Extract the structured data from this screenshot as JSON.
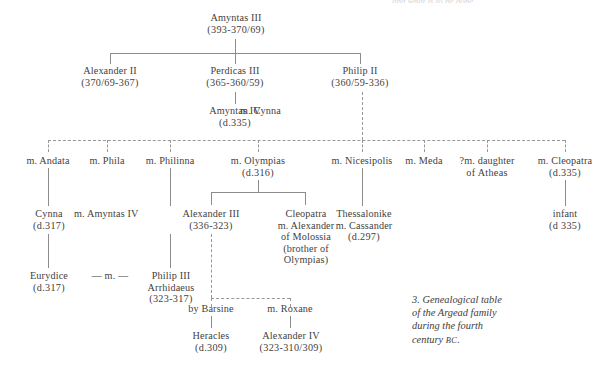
{
  "figure": {
    "caption_line1": "3. Genealogical table",
    "caption_line2": "of the Argead family",
    "caption_line3": "during the fourth",
    "caption_line4": "century ",
    "caption_era": "BC",
    "caption_end": ".",
    "clipped_header": "and what is to be done."
  },
  "colors": {
    "ink": "#444140",
    "rule": "#8e8b88",
    "dashed_rule": "#9a9794",
    "background": "#ffffff"
  },
  "people": {
    "amyntas3": {
      "name": "Amyntas III",
      "dates": "(393-370/69)"
    },
    "alexander2": {
      "name": "Alexander II",
      "dates": "(370/69-367)"
    },
    "perdiccas3": {
      "name": "Perdicas III",
      "dates": "(365-360/59)"
    },
    "philip2": {
      "name": "Philip II",
      "dates": "(360/59-336)"
    },
    "amyntas4": {
      "name": "Amyntas IV",
      "dates": "(d.335)"
    },
    "cynna_wife": {
      "name": "m. Cynna",
      "dates": ""
    },
    "audata": {
      "name": "m. Andata",
      "dates": ""
    },
    "phila": {
      "name": "m. Phila",
      "dates": ""
    },
    "philinna": {
      "name": "m. Philinna",
      "dates": ""
    },
    "olympias": {
      "name": "m. Olympias",
      "dates": "(d.316)"
    },
    "nicesipolis": {
      "name": "m. Nicesipolis",
      "dates": ""
    },
    "meda": {
      "name": "m. Meda",
      "dates": ""
    },
    "atheas_l1": {
      "name": "?m. daughter",
      "dates": "of Atheas"
    },
    "cleopatra_w": {
      "name": "m. Cleopatra",
      "dates": "(d.335)"
    },
    "cynna": {
      "name": "Cynna",
      "dates": "(d.317)"
    },
    "m_amyntas4": {
      "name": "m. Amyntas IV",
      "dates": ""
    },
    "alexander3": {
      "name": "Alexander III",
      "dates": "(336-323)"
    },
    "cleopatra_d": {
      "name": "Cleopatra",
      "l2": "m. Alexander",
      "l3": "of Molossia",
      "l4": "(brother of",
      "l5": "Olympias)"
    },
    "thessalonike": {
      "name": "Thessalonike",
      "l2": "m. Cassander",
      "l3": "(d.297)"
    },
    "infant": {
      "name": "infant",
      "dates": "(d 335)"
    },
    "eurydice": {
      "name": "Eurydice",
      "dates": "(d.317)"
    },
    "marriage_link": {
      "name": "—  m.  —",
      "dates": ""
    },
    "philip3": {
      "name": "Philip III",
      "l2": "Arrhidaeus",
      "l3": "(323-317)"
    },
    "barsine": {
      "name": "by Barsine",
      "dates": ""
    },
    "roxane": {
      "name": "m. Roxane",
      "dates": ""
    },
    "heracles": {
      "name": "Heracles",
      "dates": "(d.309)"
    },
    "alexander4": {
      "name": "Alexander IV",
      "dates": "(323-310/309)"
    }
  }
}
